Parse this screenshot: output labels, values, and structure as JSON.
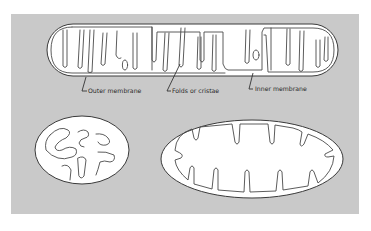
{
  "diagram": {
    "background_color": "#c9c9c9",
    "labels": {
      "outer_membrane": "Outer membrane",
      "folds": "Folds or cristae",
      "inner_membrane": "Inner membrane"
    },
    "figures": [
      {
        "name": "elongated-mitochondrion",
        "shape": "capsule",
        "labeled": true
      },
      {
        "name": "small-oval-mitochondrion",
        "shape": "oval",
        "labeled": false
      },
      {
        "name": "large-oval-mitochondrion",
        "shape": "oval",
        "labeled": false
      }
    ]
  }
}
